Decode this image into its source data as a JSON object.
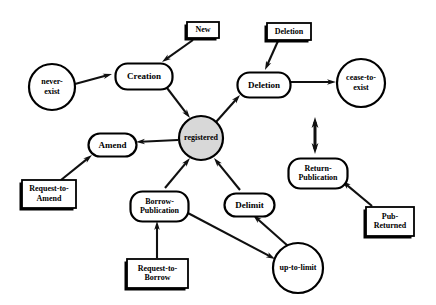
{
  "diagram": {
    "background_color": "#ffffff",
    "line_color": "#101010",
    "shadow_color": "#000000",
    "registered_fill": "#d8d8d8",
    "nodes": [
      {
        "id": "never-exist",
        "label_line1": "never-",
        "label_line2": "exist",
        "kind": "state-circle",
        "cx": 52,
        "cy": 87,
        "r": 23,
        "font_size": 8
      },
      {
        "id": "cease-to-exist",
        "label_line1": "cease-to-",
        "label_line2": "exist",
        "kind": "state-circle",
        "cx": 361,
        "cy": 83,
        "r": 24,
        "font_size": 8
      },
      {
        "id": "registered",
        "label_line1": "registered",
        "label_line2": "",
        "kind": "state-circle-filled",
        "cx": 201,
        "cy": 138,
        "r": 22,
        "font_size": 8
      },
      {
        "id": "up-to-limit",
        "label_line1": "up-to-limit",
        "label_line2": "",
        "kind": "state-circle",
        "cx": 298,
        "cy": 268,
        "r": 25,
        "font_size": 8
      },
      {
        "id": "creation",
        "label_line1": "Creation",
        "label_line2": "",
        "kind": "operation-rounded",
        "x": 113,
        "y": 61,
        "w": 57,
        "h": 26,
        "font_size": 9
      },
      {
        "id": "deletion-op",
        "label_line1": "Deletion",
        "label_line2": "",
        "kind": "operation-rounded",
        "x": 235,
        "y": 70,
        "w": 53,
        "h": 25,
        "font_size": 9
      },
      {
        "id": "amend",
        "label_line1": "Amend",
        "label_line2": "",
        "kind": "operation-rounded",
        "x": 86,
        "y": 131,
        "w": 48,
        "h": 23,
        "font_size": 9
      },
      {
        "id": "borrow-publication",
        "label_line1": "Borrow-",
        "label_line2": "Publication",
        "kind": "operation-rounded",
        "x": 128,
        "y": 189,
        "w": 58,
        "h": 30,
        "font_size": 8
      },
      {
        "id": "delimit",
        "label_line1": "Delimit",
        "label_line2": "",
        "kind": "operation-rounded",
        "x": 222,
        "y": 191,
        "w": 50,
        "h": 23,
        "font_size": 9
      },
      {
        "id": "return-publication",
        "label_line1": "Return-",
        "label_line2": "Publication",
        "kind": "operation-rounded",
        "x": 286,
        "y": 156,
        "w": 59,
        "h": 30,
        "font_size": 8
      },
      {
        "id": "new",
        "label_line1": "New",
        "label_line2": "",
        "kind": "event-box",
        "x": 187,
        "y": 22,
        "w": 32,
        "h": 16,
        "font_size": 8
      },
      {
        "id": "deletion-event",
        "label_line1": "Deletion",
        "label_line2": "",
        "kind": "event-box",
        "x": 267,
        "y": 23,
        "w": 44,
        "h": 17,
        "font_size": 8
      },
      {
        "id": "request-to-amend",
        "label_line1": "Request-to-",
        "label_line2": "Amend",
        "kind": "event-box",
        "x": 22,
        "y": 180,
        "w": 54,
        "h": 28,
        "font_size": 8
      },
      {
        "id": "request-to-borrow",
        "label_line1": "Request-to-",
        "label_line2": "Borrow",
        "kind": "event-box",
        "x": 127,
        "y": 259,
        "w": 61,
        "h": 29,
        "font_size": 8
      },
      {
        "id": "pub-returned",
        "label_line1": "Pub-",
        "label_line2": "Returned",
        "kind": "event-box",
        "x": 366,
        "y": 207,
        "w": 48,
        "h": 29,
        "font_size": 8
      }
    ],
    "edges": [
      {
        "from": "never-exist",
        "to": "creation",
        "arrow": "single",
        "x1": 75,
        "y1": 84,
        "x2": 112,
        "y2": 74
      },
      {
        "from": "new",
        "to": "creation",
        "arrow": "single",
        "x1": 193,
        "y1": 40,
        "x2": 162,
        "y2": 62
      },
      {
        "from": "creation",
        "to": "registered",
        "arrow": "single",
        "x1": 164,
        "y1": 84,
        "x2": 190,
        "y2": 118
      },
      {
        "from": "registered",
        "to": "deletion-op",
        "arrow": "single",
        "x1": 216,
        "y1": 122,
        "x2": 240,
        "y2": 95
      },
      {
        "from": "deletion-event",
        "to": "deletion-op",
        "arrow": "single",
        "x1": 278,
        "y1": 41,
        "x2": 265,
        "y2": 70
      },
      {
        "from": "deletion-op",
        "to": "cease-to-exist",
        "arrow": "single",
        "x1": 289,
        "y1": 82,
        "x2": 336,
        "y2": 82
      },
      {
        "from": "registered",
        "to": "amend",
        "arrow": "single",
        "x1": 178,
        "y1": 140,
        "x2": 136,
        "y2": 142
      },
      {
        "from": "request-to-amend",
        "to": "amend",
        "arrow": "single",
        "x1": 61,
        "y1": 180,
        "x2": 92,
        "y2": 155
      },
      {
        "from": "borrow-publication",
        "to": "registered",
        "arrow": "single",
        "x1": 165,
        "y1": 188,
        "x2": 190,
        "y2": 158
      },
      {
        "from": "request-to-borrow",
        "to": "borrow-publication",
        "arrow": "single",
        "x1": 157,
        "y1": 258,
        "x2": 157,
        "y2": 221
      },
      {
        "from": "delimit",
        "to": "registered",
        "arrow": "single",
        "x1": 240,
        "y1": 190,
        "x2": 214,
        "y2": 158
      },
      {
        "from": "up-to-limit",
        "to": "delimit",
        "arrow": "single",
        "x1": 288,
        "y1": 246,
        "x2": 253,
        "y2": 215
      },
      {
        "from": "borrow-publication",
        "to": "up-to-limit",
        "arrow": "single",
        "x1": 186,
        "y1": 212,
        "x2": 275,
        "y2": 259
      },
      {
        "from": "registered",
        "to": "return-publication",
        "arrow": "double",
        "x1": 315,
        "y1": 117,
        "x2": 315,
        "y2": 154
      },
      {
        "from": "pub-returned",
        "to": "return-publication",
        "arrow": "single",
        "x1": 372,
        "y1": 206,
        "x2": 342,
        "y2": 181
      }
    ]
  }
}
